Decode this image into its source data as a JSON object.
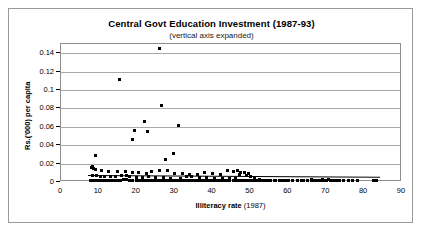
{
  "chart_data": {
    "type": "scatter",
    "title": "Central Govt Education Investment (1987-93)",
    "subtitle": "(vertical axis expanded)",
    "xlabel": "Illiteracy rate (1987)",
    "xlabel_bold": "Illiteracy rate",
    "xlabel_plain": " (1987)",
    "ylabel": "Rs.('000) per capita",
    "xlim": [
      0,
      90
    ],
    "ylim": [
      0,
      0.15
    ],
    "xticks": [
      0,
      10,
      20,
      30,
      40,
      50,
      60,
      70,
      80,
      90
    ],
    "yticks": [
      0,
      0.02,
      0.04,
      0.06,
      0.08,
      0.1,
      0.12,
      0.14
    ],
    "ytick_labels": [
      "0",
      "0.02",
      "0.04",
      "0.06",
      "0.08",
      "0.1",
      "0.12",
      "0.14"
    ],
    "grid": true,
    "legend": false,
    "marker": "diamond",
    "marker_color": "#000000",
    "trendline": {
      "x0": 7.0,
      "y0": 0.0075,
      "x1": 84.0,
      "y1": 0.0055,
      "color": "#000000"
    },
    "points": [
      [
        26.0,
        0.145
      ],
      [
        15.5,
        0.1115
      ],
      [
        26.5,
        0.083
      ],
      [
        22.0,
        0.0655
      ],
      [
        31.0,
        0.0615
      ],
      [
        19.5,
        0.0565
      ],
      [
        22.8,
        0.0545
      ],
      [
        18.8,
        0.0465
      ],
      [
        29.8,
        0.0305
      ],
      [
        9.2,
        0.029
      ],
      [
        27.5,
        0.024
      ],
      [
        8.2,
        0.0168
      ],
      [
        8.0,
        0.0155
      ],
      [
        8.6,
        0.015
      ],
      [
        9.0,
        0.0138
      ],
      [
        10.6,
        0.0128
      ],
      [
        12.6,
        0.0118
      ],
      [
        14.8,
        0.0112
      ],
      [
        17.0,
        0.011
      ],
      [
        19.0,
        0.0105
      ],
      [
        20.5,
        0.0098
      ],
      [
        22.5,
        0.0095
      ],
      [
        24.0,
        0.0112
      ],
      [
        26.0,
        0.0122
      ],
      [
        28.0,
        0.012
      ],
      [
        30.0,
        0.0092
      ],
      [
        32.0,
        0.0088
      ],
      [
        34.0,
        0.0086
      ],
      [
        36.0,
        0.0084
      ],
      [
        38.0,
        0.0098
      ],
      [
        40.0,
        0.009
      ],
      [
        42.0,
        0.0082
      ],
      [
        44.0,
        0.0128
      ],
      [
        45.5,
        0.0112
      ],
      [
        46.5,
        0.0125
      ],
      [
        47.5,
        0.0108
      ],
      [
        48.5,
        0.0098
      ],
      [
        49.5,
        0.0092
      ],
      [
        47.0,
        0.008
      ],
      [
        49.0,
        0.0072
      ],
      [
        8.4,
        0.0075
      ],
      [
        9.4,
        0.0068
      ],
      [
        10.4,
        0.0062
      ],
      [
        11.6,
        0.0058
      ],
      [
        13.0,
        0.0056
      ],
      [
        14.4,
        0.006
      ],
      [
        16.0,
        0.0072
      ],
      [
        17.2,
        0.0066
      ],
      [
        18.2,
        0.0058
      ],
      [
        20.0,
        0.0048
      ],
      [
        21.4,
        0.0052
      ],
      [
        23.0,
        0.0062
      ],
      [
        25.0,
        0.0044
      ],
      [
        27.0,
        0.0052
      ],
      [
        29.0,
        0.004
      ],
      [
        31.5,
        0.0038
      ],
      [
        33.0,
        0.006
      ],
      [
        34.5,
        0.0058
      ],
      [
        36.5,
        0.0052
      ],
      [
        38.5,
        0.0044
      ],
      [
        40.5,
        0.0042
      ],
      [
        42.5,
        0.0038
      ],
      [
        44.5,
        0.0036
      ],
      [
        46.0,
        0.0034
      ],
      [
        7.8,
        0.002
      ],
      [
        8.6,
        0.0018
      ],
      [
        9.4,
        0.0016
      ],
      [
        10.2,
        0.0018
      ],
      [
        11.0,
        0.0015
      ],
      [
        11.8,
        0.0014
      ],
      [
        12.6,
        0.0016
      ],
      [
        13.4,
        0.0013
      ],
      [
        14.2,
        0.0015
      ],
      [
        15.0,
        0.0012
      ],
      [
        15.8,
        0.0014
      ],
      [
        16.6,
        0.0026
      ],
      [
        17.4,
        0.0022
      ],
      [
        18.2,
        0.0013
      ],
      [
        19.0,
        0.0015
      ],
      [
        19.8,
        0.0012
      ],
      [
        20.6,
        0.0014
      ],
      [
        21.4,
        0.0011
      ],
      [
        22.2,
        0.0013
      ],
      [
        23.0,
        0.0015
      ],
      [
        23.8,
        0.0012
      ],
      [
        24.6,
        0.0014
      ],
      [
        25.4,
        0.0011
      ],
      [
        26.2,
        0.0013
      ],
      [
        27.0,
        0.0012
      ],
      [
        27.8,
        0.0014
      ],
      [
        28.6,
        0.0011
      ],
      [
        29.4,
        0.0013
      ],
      [
        30.2,
        0.0012
      ],
      [
        31.0,
        0.0015
      ],
      [
        31.8,
        0.0011
      ],
      [
        32.6,
        0.0013
      ],
      [
        33.4,
        0.0012
      ],
      [
        34.2,
        0.0014
      ],
      [
        35.0,
        0.0011
      ],
      [
        35.8,
        0.0013
      ],
      [
        36.6,
        0.0012
      ],
      [
        37.4,
        0.0014
      ],
      [
        38.2,
        0.0011
      ],
      [
        39.0,
        0.0013
      ],
      [
        39.8,
        0.0012
      ],
      [
        40.6,
        0.0014
      ],
      [
        41.4,
        0.0011
      ],
      [
        42.2,
        0.0013
      ],
      [
        43.0,
        0.0012
      ],
      [
        43.8,
        0.0014
      ],
      [
        44.6,
        0.0011
      ],
      [
        45.4,
        0.0013
      ],
      [
        46.2,
        0.0012
      ],
      [
        47.0,
        0.0014
      ],
      [
        47.8,
        0.0011
      ],
      [
        48.6,
        0.0013
      ],
      [
        49.4,
        0.0012
      ],
      [
        50.2,
        0.0014
      ],
      [
        51.0,
        0.0011
      ],
      [
        51.8,
        0.0013
      ],
      [
        52.6,
        0.0012
      ],
      [
        53.4,
        0.0014
      ],
      [
        54.2,
        0.0011
      ],
      [
        55.2,
        0.0013
      ],
      [
        56.4,
        0.0012
      ],
      [
        57.6,
        0.0014
      ],
      [
        58.8,
        0.0011
      ],
      [
        60.0,
        0.0013
      ],
      [
        61.2,
        0.0012
      ],
      [
        62.4,
        0.0014
      ],
      [
        63.6,
        0.0012
      ],
      [
        65.0,
        0.0011
      ],
      [
        66.2,
        0.0013
      ],
      [
        67.0,
        0.0018
      ],
      [
        67.8,
        0.0015
      ],
      [
        68.6,
        0.002
      ],
      [
        69.4,
        0.0014
      ],
      [
        70.2,
        0.0016
      ],
      [
        71.0,
        0.0013
      ],
      [
        71.8,
        0.0015
      ],
      [
        72.6,
        0.0012
      ],
      [
        73.6,
        0.0014
      ],
      [
        74.6,
        0.0012
      ],
      [
        75.8,
        0.0013
      ],
      [
        77.0,
        0.0012
      ],
      [
        78.2,
        0.0014
      ],
      [
        82.4,
        0.0012
      ],
      [
        83.4,
        0.0013
      ],
      [
        50.0,
        0.0055
      ],
      [
        51.2,
        0.004
      ],
      [
        52.4,
        0.0022
      ],
      [
        53.6,
        0.002
      ],
      [
        55.0,
        0.0018
      ],
      [
        56.5,
        0.0016
      ],
      [
        58.0,
        0.0018
      ],
      [
        59.5,
        0.0015
      ],
      [
        61.0,
        0.0017
      ],
      [
        62.5,
        0.0015
      ],
      [
        64.0,
        0.0016
      ],
      [
        66.0,
        0.0024
      ],
      [
        69.0,
        0.003
      ],
      [
        70.5,
        0.0022
      ],
      [
        46.8,
        0.0016
      ],
      [
        48.0,
        0.0018
      ]
    ]
  }
}
